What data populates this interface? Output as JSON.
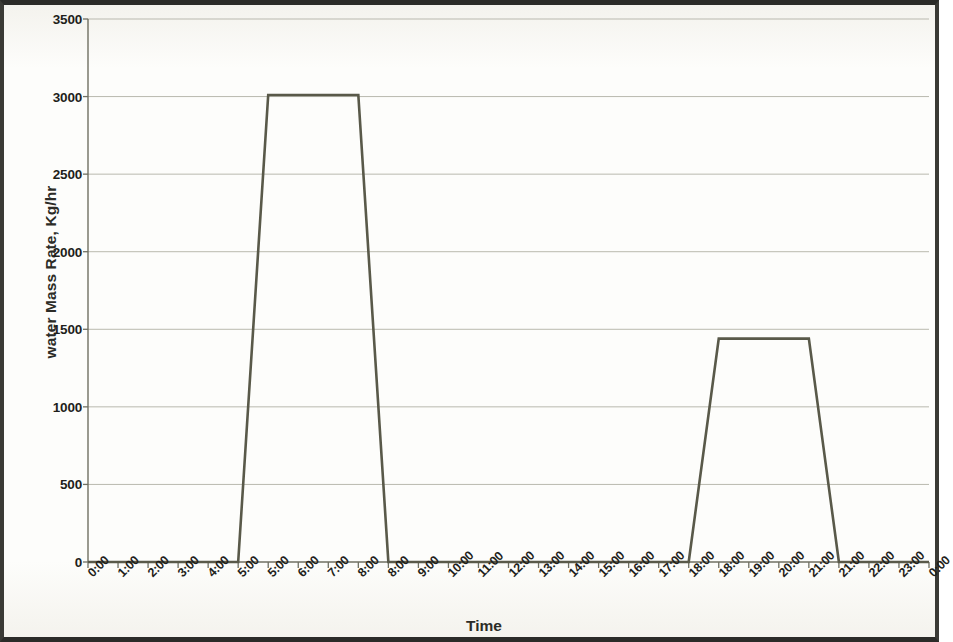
{
  "chart_data": {
    "type": "line",
    "title": "",
    "xlabel": "Time",
    "ylabel": "water Mass Rate, Kg/hr",
    "ylim": [
      0,
      3500
    ],
    "ytick_values": [
      0,
      500,
      1000,
      1500,
      2000,
      2500,
      3000,
      3500
    ],
    "ytick_labels": [
      "0",
      "500",
      "1000",
      "1500",
      "2000",
      "2500",
      "3000",
      "3500"
    ],
    "xtick_labels": [
      "0:00",
      "1:00",
      "2:00",
      "3:00",
      "4:00",
      "5:00",
      "5:00",
      "6:00",
      "7:00",
      "8:00",
      "8:00",
      "9:00",
      "10:00",
      "11:00",
      "12:00",
      "13:00",
      "14:00",
      "15:00",
      "16:00",
      "17:00",
      "18:00",
      "18:00",
      "19:00",
      "20:00",
      "21:00",
      "21:00",
      "22:00",
      "23:00",
      "0:00"
    ],
    "grid": "horizontal",
    "legend": "none",
    "series": [
      {
        "name": "water mass rate",
        "x_index": [
          0,
          1,
          2,
          3,
          4,
          5,
          6,
          7,
          8,
          9,
          10,
          11,
          12,
          13,
          14,
          15,
          16,
          17,
          18,
          19,
          20,
          21,
          22,
          23,
          24,
          25,
          26,
          27,
          28
        ],
        "values": [
          0,
          0,
          0,
          0,
          0,
          0,
          3010,
          3010,
          3010,
          3010,
          0,
          0,
          0,
          0,
          0,
          0,
          0,
          0,
          0,
          0,
          0,
          1440,
          1440,
          1440,
          1440,
          0,
          0,
          0,
          0
        ]
      }
    ],
    "annotations": {
      "plateau_1_value": 3010,
      "plateau_1_span": "5:00 - 8:00",
      "plateau_2_value": 1440,
      "plateau_2_span": "18:00 - 21:00",
      "baseline_value": 0
    },
    "colors": {
      "line": "#595949",
      "grid": "#b9b9ae",
      "axis": "#6f6f62",
      "text": "#1f1f1b",
      "background": "#fdfdfb",
      "frame": "#2b2b28"
    }
  }
}
